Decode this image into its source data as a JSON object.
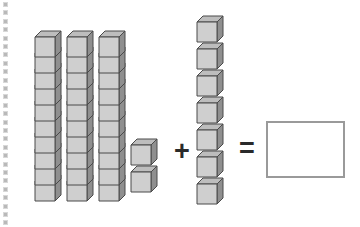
{
  "image": {
    "title": "Base-ten blocks addition problem",
    "width": 360,
    "height": 227,
    "background_color": "#ffffff"
  },
  "colors": {
    "cube_front": "#cfcfcf",
    "cube_top": "#bdbdbd",
    "cube_side": "#8f8f8f",
    "cube_outline": "#4a4a4a",
    "operator": "#2a2a2a",
    "answer_box_border": "#9a9a9a",
    "perforation_dot": "#b9b9b9"
  },
  "perforation": {
    "name": "left-edge-perforation",
    "dot_count": 27,
    "dot_spacing": 8.4,
    "start_y": 2
  },
  "equation": {
    "expression": "32 + 7 = ?",
    "plus_symbol": "+",
    "equals_symbol": "=",
    "answer_value": ""
  },
  "first_addend": {
    "name": "first-addend-group",
    "total": 32,
    "tens": 3,
    "ones": 2,
    "rods": [
      {
        "name": "tens-rod-1",
        "cube_count": 10,
        "x": 35,
        "top_y": 31
      },
      {
        "name": "tens-rod-2",
        "cube_count": 10,
        "x": 67,
        "top_y": 31
      },
      {
        "name": "tens-rod-3",
        "cube_count": 10,
        "x": 99,
        "top_y": 31
      }
    ],
    "rod_cube_height": 16,
    "ones_cubes": [
      {
        "name": "ones-cube-1",
        "x": 131,
        "y": 139
      },
      {
        "name": "ones-cube-2",
        "x": 131,
        "y": 166
      }
    ]
  },
  "second_addend": {
    "name": "second-addend-group",
    "total": 7,
    "tens": 0,
    "ones": 7,
    "ones_cubes": [
      {
        "name": "addend2-cube-1",
        "x": 197,
        "y": 16
      },
      {
        "name": "addend2-cube-2",
        "x": 197,
        "y": 43
      },
      {
        "name": "addend2-cube-3",
        "x": 197,
        "y": 70
      },
      {
        "name": "addend2-cube-4",
        "x": 197,
        "y": 97
      },
      {
        "name": "addend2-cube-5",
        "x": 197,
        "y": 124
      },
      {
        "name": "addend2-cube-6",
        "x": 197,
        "y": 151
      },
      {
        "name": "addend2-cube-7",
        "x": 197,
        "y": 178
      }
    ]
  }
}
